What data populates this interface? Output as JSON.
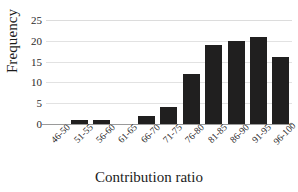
{
  "chart_data": {
    "type": "bar",
    "title": "",
    "subtitle": "",
    "xlabel": "Contribution ratio",
    "ylabel": "Frequency",
    "categories": [
      "46-50",
      "51-55",
      "56-60",
      "61-65",
      "66-70",
      "71-75",
      "76-80",
      "81-85",
      "86-90",
      "91-95",
      "96-100"
    ],
    "values": [
      0,
      1,
      1,
      0,
      2,
      4,
      12,
      19,
      20,
      21,
      16
    ],
    "ylim": [
      0,
      25
    ],
    "ytick_labels": [
      "25",
      "20",
      "15",
      "10",
      "5",
      "0"
    ],
    "ytick_values": [
      25,
      20,
      15,
      10,
      5,
      0
    ],
    "ytick_step": 5,
    "xtick_rotation": -45,
    "grid": true,
    "grid_axis": "y",
    "legend": false,
    "legend_position": "none",
    "bar_color": "#201f1f",
    "grid_color": "#e2e2e2",
    "axis_color": "#9a9a9a",
    "text_color": "#1b1b1b",
    "background_color": "#ffffff"
  }
}
